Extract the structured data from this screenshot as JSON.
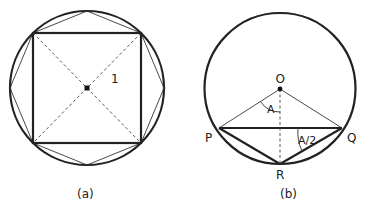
{
  "figure_a": {
    "caption": "(a)",
    "radius_label": "1",
    "description": "Circle with inscribed square and inscribed octagon; dashed diagonals through center"
  },
  "figure_b": {
    "caption": "(b)",
    "points": {
      "O": "O",
      "P": "P",
      "Q": "Q",
      "R": "R"
    },
    "angle_labels": {
      "central": "A",
      "inscribed": "A/2"
    },
    "description": "Circle with center O, chord PQ, point R on arc; dashed OR perpendicular to PQ"
  },
  "colors": {
    "stroke": "#222222",
    "background": "#ffffff"
  }
}
